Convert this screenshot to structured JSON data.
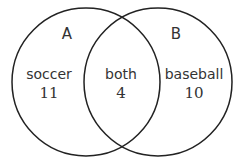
{
  "diagram": {
    "type": "venn",
    "stroke_color": "#222222",
    "background": "#ffffff",
    "sets": [
      {
        "name": "A",
        "category": "soccer",
        "count": "11"
      },
      {
        "name": "B",
        "category": "baseball",
        "count": "10"
      }
    ],
    "intersection": {
      "category": "both",
      "count": "4"
    }
  }
}
